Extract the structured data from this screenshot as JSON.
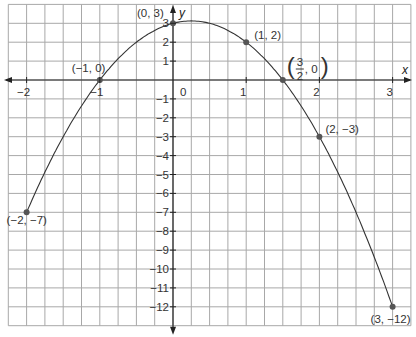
{
  "chart_data": {
    "type": "line",
    "title": "",
    "xlabel": "x",
    "ylabel": "y",
    "xlim": [
      -2.25,
      3.25
    ],
    "ylim": [
      -13,
      4
    ],
    "grid": true,
    "grid_step": {
      "x": 0.25,
      "y": 1
    },
    "x_ticks": [
      -2,
      -1,
      0,
      1,
      2,
      3
    ],
    "x_tick_labels": [
      "−2",
      "−1",
      "0",
      "1",
      "2",
      "3"
    ],
    "y_ticks": [
      3,
      2,
      1,
      -1,
      -2,
      -3,
      -4,
      -5,
      -6,
      -7,
      -8,
      -9,
      -10,
      -11,
      -12
    ],
    "y_tick_labels": [
      "3",
      "2",
      "1",
      "−1",
      "−2",
      "−3",
      "−4",
      "−5",
      "−6",
      "−7",
      "−8",
      "−9",
      "−10",
      "−11",
      "−12"
    ],
    "series": [
      {
        "name": "y = -2x^2 + x + 3",
        "x": [
          -2,
          -1,
          0,
          0.25,
          1,
          1.5,
          2,
          3
        ],
        "y": [
          -7,
          0,
          3,
          3.125,
          2,
          0,
          -3,
          -12
        ]
      }
    ],
    "points": [
      {
        "x": -2,
        "y": -7,
        "label": "(−2, −7)"
      },
      {
        "x": -1,
        "y": 0,
        "label": "(−1, 0)"
      },
      {
        "x": 0,
        "y": 3,
        "label": "(0, 3)"
      },
      {
        "x": 1,
        "y": 2,
        "label": "(1, 2)"
      },
      {
        "x": 1.5,
        "y": 0,
        "label": "(3/2, 0)"
      },
      {
        "x": 2,
        "y": -3,
        "label": "(2, −3)"
      },
      {
        "x": 3,
        "y": -12,
        "label": "(3, −12)"
      }
    ],
    "origin_label": "0",
    "colors": {
      "grid": "#a8a8a8",
      "axis": "#222222",
      "curve": "#333333",
      "point": "#555555",
      "text": "#333333"
    }
  }
}
